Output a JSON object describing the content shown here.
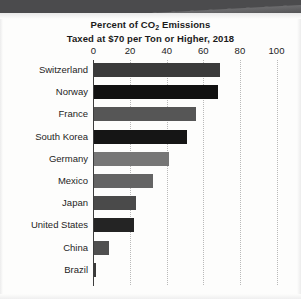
{
  "chart_data": {
    "type": "bar",
    "orientation": "horizontal",
    "title": "Percent of CO2 Emissions Taxed at $70 per Ton or Higher, 2018",
    "title_line1_pre": "Percent of CO",
    "title_line1_sub": "2",
    "title_line1_post": " Emissions",
    "title_line2": "Taxed at $70 per Ton or Higher, 2018",
    "xlabel": "",
    "ylabel": "",
    "xlim": [
      0,
      100
    ],
    "xticks": [
      0,
      20,
      40,
      60,
      80,
      100
    ],
    "xtick_labels": [
      "0",
      "20",
      "40",
      "60",
      "80",
      "100"
    ],
    "grid": "vertical-dotted",
    "legend": "none",
    "categories": [
      "Switzerland",
      "Norway",
      "France",
      "South Korea",
      "Germany",
      "Mexico",
      "Japan",
      "United States",
      "China",
      "Brazil"
    ],
    "values": [
      69,
      68,
      56,
      51,
      41,
      32,
      23,
      22,
      8,
      1
    ],
    "bar_colors": [
      "#3b3b3b",
      "#111111",
      "#565656",
      "#151515",
      "#767676",
      "#646464",
      "#4a4a4a",
      "#242424",
      "#4f4f4f",
      "#3a3a3a"
    ],
    "axis_color": "#3c3c3c",
    "grid_color": "#b9b9b9",
    "background": "#fdfdfc",
    "text_color": "#1d1d1d"
  }
}
